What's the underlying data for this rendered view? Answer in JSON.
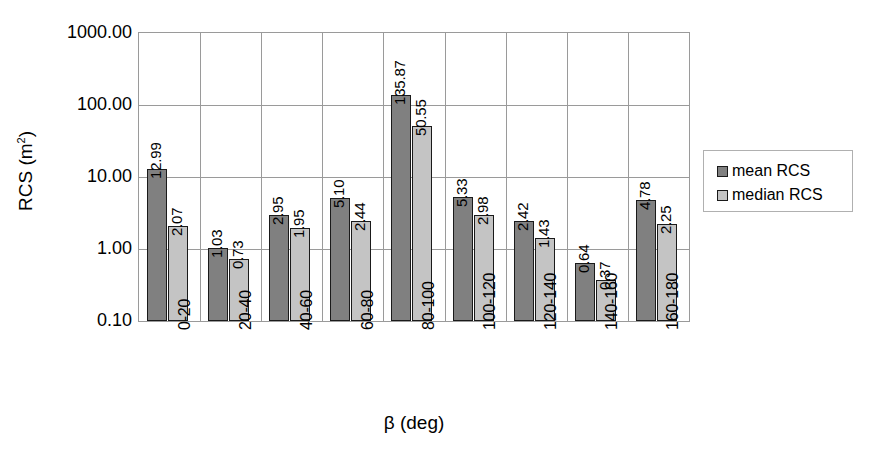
{
  "chart_data": {
    "type": "bar",
    "title": "",
    "xlabel": "β (deg)",
    "ylabel": "RCS (m²)",
    "ylabel_text": "RCS (m",
    "ylabel_sup": "2",
    "ylabel_tail": ")",
    "yscale": "log",
    "ylim": [
      0.1,
      1000.0
    ],
    "grid": true,
    "legend_position": "right",
    "categories": [
      "0-20",
      "20-40",
      "40-60",
      "60-80",
      "80-100",
      "100-120",
      "120-140",
      "140-160",
      "160-180"
    ],
    "y_ticks": [
      "1000.00",
      "100.00",
      "10.00",
      "1.00",
      "0.10"
    ],
    "y_tick_values": [
      1000.0,
      100.0,
      10.0,
      1.0,
      0.1
    ],
    "series": [
      {
        "name": "mean RCS",
        "color": "#808080",
        "values": [
          12.99,
          1.03,
          2.95,
          5.1,
          135.87,
          5.33,
          2.42,
          0.64,
          4.78
        ],
        "labels": [
          "12.99",
          "1.03",
          "2.95",
          "5.10",
          "135.87",
          "5.33",
          "2.42",
          "0.64",
          "4.78"
        ]
      },
      {
        "name": "median RCS",
        "color": "#c4c4c4",
        "values": [
          2.07,
          0.73,
          1.95,
          2.44,
          50.55,
          2.98,
          1.43,
          0.37,
          2.25
        ],
        "labels": [
          "2.07",
          "0.73",
          "1.95",
          "2.44",
          "50.55",
          "2.98",
          "1.43",
          "0.37",
          "2.25"
        ]
      }
    ]
  },
  "legend": {
    "items": [
      {
        "label": "mean RCS",
        "color": "#808080"
      },
      {
        "label": "median RCS",
        "color": "#c4c4c4"
      }
    ]
  },
  "colors": {
    "mean": "#808080",
    "median": "#c4c4c4",
    "grid": "#9a9a9a",
    "bar_outline": "#1a1a1a",
    "text": "#000000"
  }
}
